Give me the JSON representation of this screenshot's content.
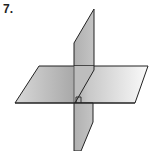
{
  "problem": {
    "number_label": "7."
  },
  "figure": {
    "colors": {
      "plane_fill_dark": "#a9a9a9",
      "plane_fill_light": "#f2f2f2",
      "vertical_fill": "#b8b8b8",
      "stroke": "#222222"
    },
    "horizontal_plane": {
      "points": [
        [
          39,
          66
        ],
        [
          148,
          66
        ],
        [
          135,
          103
        ],
        [
          15,
          103
        ]
      ]
    },
    "vertical_plane": {
      "points": [
        [
          74,
          43
        ],
        [
          94,
          9
        ],
        [
          94,
          122
        ],
        [
          81,
          151
        ],
        [
          74,
          151
        ]
      ]
    },
    "right_angle_marker": {
      "points": [
        [
          76,
          103
        ],
        [
          76,
          97
        ],
        [
          81,
          97
        ],
        [
          81,
          103
        ]
      ]
    }
  }
}
